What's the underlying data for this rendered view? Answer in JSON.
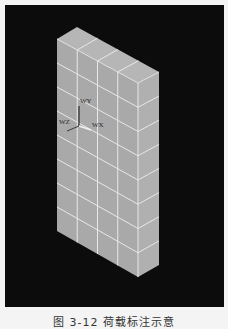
{
  "figure": {
    "caption": "图 3-12  荷载标注示意",
    "background_color": "#0c0c0c",
    "page_color": "#f4f4f4"
  },
  "model": {
    "type": "isometric-wall-block",
    "face_color_front": "#a9a9a9",
    "face_color_side": "#b0b0b0",
    "face_color_top": "#b6b6b6",
    "grid_line_color": "#e8e8e8",
    "columns": 4,
    "rows": 8,
    "depth_divisions": 1,
    "vertices": {
      "top_front_left": [
        57,
        39
      ],
      "top_front_right": [
        138,
        83
      ],
      "top_back_left": [
        77,
        27
      ],
      "top_back_right": [
        159,
        72
      ],
      "bottom_front_left": [
        57,
        231
      ],
      "bottom_front_right": [
        138,
        277
      ],
      "bottom_back_right": [
        159,
        265
      ]
    }
  },
  "axes": {
    "origin": [
      79,
      126
    ],
    "labels": {
      "y": "WY",
      "z": "WZ",
      "x": "WX"
    }
  }
}
